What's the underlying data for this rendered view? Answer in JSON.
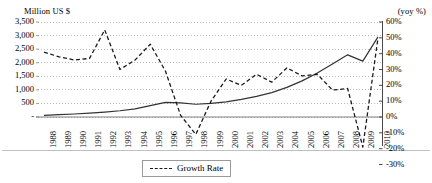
{
  "chart_data": {
    "type": "line",
    "title": "",
    "left_axis_title": "Million US $",
    "right_axis_title": "(yoy %)",
    "xlabel": "",
    "grid": "horizontal-dotted",
    "legend_position": "bottom-center",
    "categories": [
      "1988",
      "1989",
      "1990",
      "1991",
      "1992",
      "1993",
      "1994",
      "1995",
      "1996",
      "1997",
      "1998",
      "1999",
      "2000",
      "2001",
      "2002",
      "2003",
      "2004",
      "2005",
      "2006",
      "2007",
      "2008",
      "2009",
      "2010"
    ],
    "left_axis": {
      "label": "Million US $",
      "ticks": [
        "3,500",
        "3,000",
        "2,500",
        "2,000",
        "1,500",
        "1,000",
        "500",
        "-"
      ],
      "values": [
        3500,
        3000,
        2500,
        2000,
        1500,
        1000,
        500,
        0
      ],
      "min": 0,
      "max": 3500
    },
    "right_axis": {
      "label": "(yoy %)",
      "ticks": [
        "60%",
        "50%",
        "40%",
        "30%",
        "20%",
        "10%",
        "0%",
        "-10%",
        "-20%",
        "-30%"
      ],
      "values": [
        60,
        50,
        40,
        30,
        20,
        10,
        0,
        -10,
        -20,
        -30
      ],
      "min": -30,
      "max": 60
    },
    "series": [
      {
        "name": "Value",
        "axis": "left",
        "style": "solid",
        "color": "#333333",
        "in_legend": false,
        "values": [
          60,
          85,
          110,
          140,
          180,
          230,
          300,
          420,
          540,
          520,
          470,
          500,
          560,
          650,
          760,
          900,
          1090,
          1330,
          1620,
          1950,
          2290,
          2060,
          2950
        ]
      },
      {
        "name": "Growth Rate",
        "axis": "right",
        "style": "dashed",
        "color": "#1a1a1a",
        "in_legend": true,
        "values": [
          41,
          38,
          36,
          37,
          55,
          30,
          36,
          46,
          29,
          1,
          -11,
          10,
          24,
          20,
          27,
          22,
          31,
          26,
          27,
          17,
          18,
          -19,
          50
        ]
      }
    ],
    "legend": [
      {
        "label": "Growth Rate",
        "style": "dashed"
      }
    ]
  },
  "plot": {
    "x_start": 44,
    "x_end": 378,
    "y_top": 22,
    "y_zero": 117
  }
}
